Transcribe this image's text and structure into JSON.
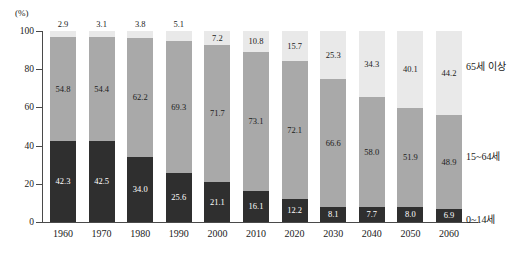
{
  "axis": {
    "unit_label": "(%)",
    "y_ticks": [
      "100",
      "80",
      "60",
      "40",
      "20",
      "0"
    ],
    "x_labels": [
      "1960",
      "1970",
      "1980",
      "1990",
      "2000",
      "2010",
      "2020",
      "2030",
      "2040",
      "2050",
      "2060"
    ]
  },
  "legend": {
    "items": [
      {
        "key": "old",
        "label": "65세 이상",
        "color": "#e9e9e9"
      },
      {
        "key": "work",
        "label": "15~64세",
        "color": "#a9a9a9"
      },
      {
        "key": "young",
        "label": "0~14세",
        "color": "#2f2f2f"
      }
    ]
  },
  "chart_data": {
    "type": "bar",
    "subtype": "stacked-vertical-100",
    "title": "",
    "xlabel": "",
    "ylabel": "(%)",
    "ylim": [
      0,
      100
    ],
    "grid": false,
    "legend_position": "right",
    "categories": [
      "1960",
      "1970",
      "1980",
      "1990",
      "2000",
      "2010",
      "2020",
      "2030",
      "2040",
      "2050",
      "2060"
    ],
    "series": [
      {
        "name": "0~14세",
        "color": "#2f2f2f",
        "values": [
          42.3,
          42.5,
          34.0,
          25.6,
          21.1,
          16.1,
          12.2,
          8.1,
          7.7,
          8.0,
          6.9
        ],
        "labels": [
          "42.3",
          "42.5",
          "34.0",
          "25.6",
          "21.1",
          "16.1",
          "12.2",
          "8.1",
          "7.7",
          "8.0",
          "6.9"
        ]
      },
      {
        "name": "15~64세",
        "color": "#a9a9a9",
        "values": [
          54.8,
          54.4,
          62.2,
          69.3,
          71.7,
          73.1,
          72.1,
          66.6,
          58.0,
          51.9,
          48.9
        ],
        "labels": [
          "54.8",
          "54.4",
          "62.2",
          "69.3",
          "71.7",
          "73.1",
          "72.1",
          "66.6",
          "58.0",
          "51.9",
          "48.9"
        ]
      },
      {
        "name": "65세 이상",
        "color": "#e9e9e9",
        "values": [
          2.9,
          3.1,
          3.8,
          5.1,
          7.2,
          10.8,
          15.7,
          25.3,
          34.3,
          40.1,
          44.2
        ],
        "labels": [
          "2.9",
          "3.1",
          "3.8",
          "5.1",
          "7.2",
          "10.8",
          "15.7",
          "25.3",
          "34.3",
          "40.1",
          "44.2"
        ]
      }
    ]
  }
}
